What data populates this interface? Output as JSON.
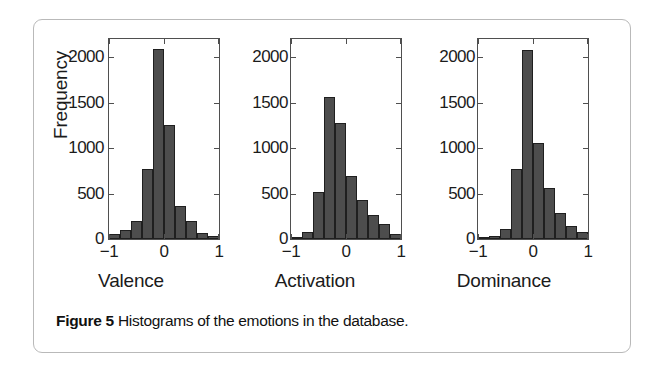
{
  "caption": {
    "label": "Figure 5",
    "text": "Histograms of the emotions in the database."
  },
  "axis": {
    "ylabel": "Frequency",
    "yticks": [
      "0",
      "500",
      "1000",
      "1500",
      "2000"
    ],
    "xticks": [
      "−1",
      "0",
      "1"
    ]
  },
  "chart_data": [
    {
      "type": "bar",
      "title": "",
      "xlabel": "Valence",
      "ylabel": "Frequency",
      "xlim": [
        -1,
        1
      ],
      "ylim": [
        0,
        2200
      ],
      "ytick_values": [
        0,
        500,
        1000,
        1500,
        2000
      ],
      "xtick_values": [
        -1,
        0,
        1
      ],
      "grid": false,
      "legend": null,
      "bin_width": 0.2,
      "bin_centers": [
        -0.9,
        -0.7,
        -0.5,
        -0.3,
        -0.1,
        0.1,
        0.3,
        0.5,
        0.7,
        0.9
      ],
      "categories": [
        "-0.9",
        "-0.7",
        "-0.5",
        "-0.3",
        "-0.1",
        "0.1",
        "0.3",
        "0.5",
        "0.7",
        "0.9"
      ],
      "values": [
        55,
        95,
        200,
        770,
        2090,
        1250,
        360,
        200,
        70,
        30
      ]
    },
    {
      "type": "bar",
      "title": "",
      "xlabel": "Activation",
      "ylabel": "Frequency",
      "xlim": [
        -1,
        1
      ],
      "ylim": [
        0,
        2200
      ],
      "ytick_values": [
        0,
        500,
        1000,
        1500,
        2000
      ],
      "xtick_values": [
        -1,
        0,
        1
      ],
      "grid": false,
      "legend": null,
      "bin_width": 0.2,
      "bin_centers": [
        -0.9,
        -0.7,
        -0.5,
        -0.3,
        -0.1,
        0.1,
        0.3,
        0.5,
        0.7,
        0.9
      ],
      "categories": [
        "-0.9",
        "-0.7",
        "-0.5",
        "-0.3",
        "-0.1",
        "0.1",
        "0.3",
        "0.5",
        "0.7",
        "0.9"
      ],
      "values": [
        20,
        75,
        515,
        1560,
        1280,
        690,
        425,
        265,
        160,
        50
      ]
    },
    {
      "type": "bar",
      "title": "",
      "xlabel": "Dominance",
      "ylabel": "Frequency",
      "xlim": [
        -1,
        1
      ],
      "ylim": [
        0,
        2200
      ],
      "ytick_values": [
        0,
        500,
        1000,
        1500,
        2000
      ],
      "xtick_values": [
        -1,
        0,
        1
      ],
      "grid": false,
      "legend": null,
      "bin_width": 0.2,
      "bin_centers": [
        -0.9,
        -0.7,
        -0.5,
        -0.3,
        -0.1,
        0.1,
        0.3,
        0.5,
        0.7,
        0.9
      ],
      "categories": [
        "-0.9",
        "-0.7",
        "-0.5",
        "-0.3",
        "-0.1",
        "0.1",
        "0.3",
        "0.5",
        "0.7",
        "0.9"
      ],
      "values": [
        10,
        35,
        110,
        770,
        2080,
        1060,
        560,
        290,
        145,
        80
      ]
    }
  ],
  "colors": {
    "bar_fill": "#4d4d4d",
    "bar_edge": "#1f1f1f",
    "axis_line": "#4f4f4f",
    "panel_border": "#b9b9b9",
    "text": "#1b1b1b"
  }
}
